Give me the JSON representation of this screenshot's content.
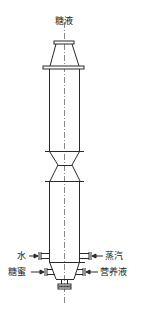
{
  "diagram": {
    "type": "fermentation tower / column vessel schematic",
    "line_color": "#2a2a2a",
    "centerline_color": "#555555",
    "labels": {
      "top_inlet": "糖液",
      "left_upper": "水",
      "right_upper": "蒸汽",
      "left_lower": "糖蜜",
      "right_lower": "营养液"
    }
  }
}
